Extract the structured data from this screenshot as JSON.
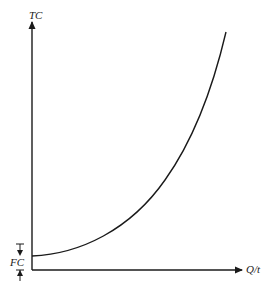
{
  "diagram": {
    "title": "",
    "y_axis_label": "TC",
    "x_axis_label": "Q/t",
    "fixed_cost_label": "FC",
    "curve": {
      "name": "total-cost-curve",
      "shape": "convex increasing",
      "start": "FC intercept on TC axis",
      "description": "Total cost rises at an increasing rate with output, starting from fixed cost"
    },
    "colors": {
      "line": "#1a1a1a",
      "background": "#ffffff"
    }
  }
}
